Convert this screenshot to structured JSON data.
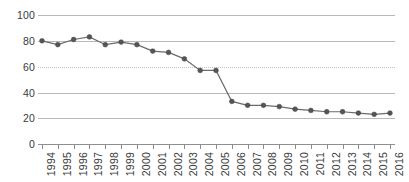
{
  "chart_data": {
    "type": "line",
    "title": "",
    "subtitle": "",
    "xlabel": "",
    "ylabel": "",
    "categories": [
      "1994",
      "1995",
      "1996",
      "1997",
      "1998",
      "1999",
      "2000",
      "2001",
      "2002",
      "2003",
      "2004",
      "2005",
      "2006",
      "2007",
      "2008",
      "2009",
      "2010",
      "2011",
      "2012",
      "2013",
      "2014",
      "2015",
      "2016"
    ],
    "values": [
      80,
      77,
      81,
      83,
      77,
      79,
      77,
      72,
      71,
      66,
      57,
      57,
      33,
      30,
      30,
      29,
      27,
      26,
      25,
      25,
      24,
      23,
      24
    ],
    "x": [
      1994,
      1995,
      1996,
      1997,
      1998,
      1999,
      2000,
      2001,
      2002,
      2003,
      2004,
      2005,
      2006,
      2007,
      2008,
      2009,
      2010,
      2011,
      2012,
      2013,
      2014,
      2015,
      2016
    ],
    "ylim": [
      0,
      100
    ],
    "xlim": [
      1994,
      2016
    ],
    "yticks": [
      0,
      20,
      40,
      60,
      80,
      100
    ],
    "ytick_labels": [
      "0",
      "20",
      "40",
      "60",
      "80",
      "100"
    ],
    "xtick_labels": [
      "1994",
      "1995",
      "1996",
      "1997",
      "1998",
      "1999",
      "2000",
      "2001",
      "2002",
      "2003",
      "2004",
      "2005",
      "2006",
      "2007",
      "2008",
      "2009",
      "2010",
      "2011",
      "2012",
      "2013",
      "2014",
      "2015",
      "2016"
    ],
    "grid": true,
    "grid_axis": "y",
    "legend": false,
    "legend_position": "none",
    "annotations": [],
    "series": [
      {
        "name": "",
        "values": [
          80,
          77,
          81,
          83,
          77,
          79,
          77,
          72,
          71,
          66,
          57,
          57,
          33,
          30,
          30,
          29,
          27,
          26,
          25,
          25,
          24,
          23,
          24
        ],
        "line_color": "#6b6b6b",
        "marker_color": "#555555",
        "marker": "circle"
      }
    ]
  },
  "style": {
    "background": "#ffffff",
    "gridline_color": "#b9b9b9",
    "axis_color": "#8e8e8e",
    "tick_text_color": "#3a3a3a"
  }
}
